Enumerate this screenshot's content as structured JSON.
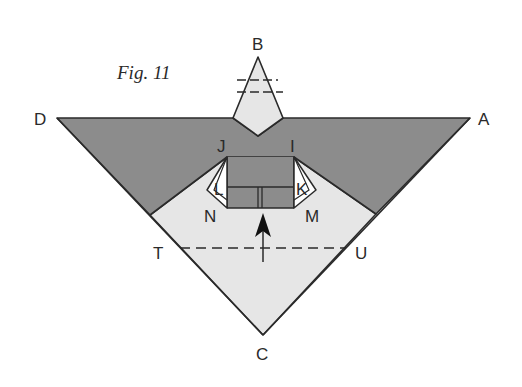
{
  "figure": {
    "caption": "Fig. 11",
    "labels": {
      "A": "A",
      "B": "B",
      "C": "C",
      "D": "D",
      "I": "I",
      "J": "J",
      "K": "K",
      "L": "L",
      "M": "M",
      "N": "N",
      "T": "T",
      "U": "U"
    },
    "colors": {
      "dark_fill": "#8c8c8c",
      "light_fill": "#e6e6e6",
      "stroke": "#2a2a2a",
      "background": "#ffffff"
    },
    "annotations": {
      "fold_line": "dashed line T–U",
      "tip_fold_lines": "two dashed lines across point B",
      "arrow": "upward arrow below M–N edge"
    }
  }
}
